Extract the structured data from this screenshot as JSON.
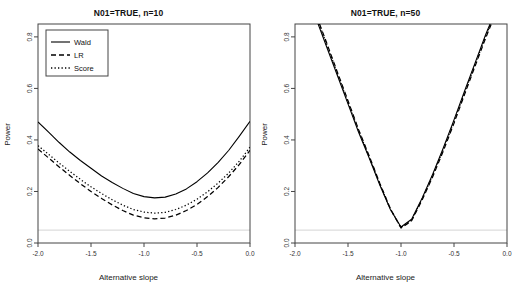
{
  "figure": {
    "background": "#ffffff",
    "axis_color": "#444444",
    "line_color": "#000000",
    "ref_line_color": "#dddddd"
  },
  "panels": [
    {
      "id": "left",
      "title": "N01=TRUE, n=10",
      "xlabel": "Alternative slope",
      "ylabel": "Power",
      "xticks": [
        "-2.0",
        "-1.5",
        "-1.0",
        "-0.5",
        "0.0"
      ],
      "yticks": [
        "0.0",
        "0.2",
        "0.4",
        "0.6",
        "0.8"
      ],
      "legend": {
        "visible": true,
        "items": [
          {
            "label": "Wald",
            "style": "solid"
          },
          {
            "label": "LR",
            "style": "dashed"
          },
          {
            "label": "Score",
            "style": "dotted"
          }
        ]
      }
    },
    {
      "id": "right",
      "title": "N01=TRUE, n=50",
      "xlabel": "Alternative slope",
      "ylabel": "Power",
      "xticks": [
        "-2.0",
        "-1.5",
        "-1.0",
        "-0.5",
        "0.0"
      ],
      "yticks": [
        "0.0",
        "0.2",
        "0.4",
        "0.6",
        "0.8"
      ],
      "legend": {
        "visible": false,
        "items": []
      }
    }
  ],
  "chart_data": [
    {
      "type": "line",
      "title": "N01=TRUE, n=10",
      "xlabel": "Alternative slope",
      "ylabel": "Power",
      "xlim": [
        -2.0,
        0.0
      ],
      "ylim": [
        0.0,
        0.85
      ],
      "grid": false,
      "legend_position": "top-left",
      "reference_line": {
        "y": 0.05,
        "style": "solid",
        "color": "#dddddd"
      },
      "x": [
        -2.0,
        -1.9,
        -1.8,
        -1.7,
        -1.6,
        -1.5,
        -1.4,
        -1.3,
        -1.2,
        -1.1,
        -1.0,
        -0.9,
        -0.8,
        -0.7,
        -0.6,
        -0.5,
        -0.4,
        -0.3,
        -0.2,
        -0.1,
        0.0
      ],
      "series": [
        {
          "name": "Wald",
          "style": "solid",
          "values": [
            0.47,
            0.43,
            0.39,
            0.353,
            0.32,
            0.29,
            0.26,
            0.235,
            0.212,
            0.192,
            0.18,
            0.175,
            0.178,
            0.19,
            0.21,
            0.238,
            0.272,
            0.313,
            0.36,
            0.415,
            0.472
          ]
        },
        {
          "name": "LR",
          "style": "dashed",
          "values": [
            0.365,
            0.33,
            0.295,
            0.262,
            0.23,
            0.2,
            0.173,
            0.148,
            0.126,
            0.108,
            0.098,
            0.094,
            0.097,
            0.108,
            0.126,
            0.15,
            0.18,
            0.216,
            0.258,
            0.305,
            0.36
          ]
        },
        {
          "name": "Score",
          "style": "dotted",
          "values": [
            0.378,
            0.344,
            0.31,
            0.278,
            0.247,
            0.218,
            0.192,
            0.168,
            0.147,
            0.13,
            0.12,
            0.116,
            0.119,
            0.13,
            0.147,
            0.17,
            0.199,
            0.233,
            0.272,
            0.318,
            0.372
          ]
        }
      ]
    },
    {
      "type": "line",
      "title": "N01=TRUE, n=50",
      "xlabel": "Alternative slope",
      "ylabel": "Power",
      "xlim": [
        -2.0,
        0.0
      ],
      "ylim": [
        0.0,
        0.85
      ],
      "grid": false,
      "legend_position": "none",
      "reference_line": {
        "y": 0.05,
        "style": "solid",
        "color": "#dddddd"
      },
      "x": [
        -1.9,
        -1.8,
        -1.7,
        -1.6,
        -1.5,
        -1.4,
        -1.3,
        -1.2,
        -1.1,
        -1.0,
        -0.9,
        -0.8,
        -0.7,
        -0.6,
        -0.5,
        -0.4,
        -0.3,
        -0.2,
        -0.15
      ],
      "series": [
        {
          "name": "Wald",
          "style": "solid",
          "values": [
            0.98,
            0.87,
            0.76,
            0.65,
            0.54,
            0.43,
            0.33,
            0.225,
            0.13,
            0.062,
            0.092,
            0.175,
            0.268,
            0.37,
            0.478,
            0.59,
            0.7,
            0.81,
            0.86
          ]
        },
        {
          "name": "LR",
          "style": "dashed",
          "values": [
            0.995,
            0.885,
            0.775,
            0.663,
            0.552,
            0.44,
            0.338,
            0.232,
            0.133,
            0.058,
            0.086,
            0.168,
            0.258,
            0.358,
            0.465,
            0.577,
            0.688,
            0.797,
            0.848
          ]
        },
        {
          "name": "Score",
          "style": "dotted",
          "values": [
            0.99,
            0.88,
            0.77,
            0.658,
            0.547,
            0.436,
            0.334,
            0.229,
            0.131,
            0.06,
            0.089,
            0.172,
            0.263,
            0.364,
            0.471,
            0.583,
            0.694,
            0.803,
            0.854
          ]
        }
      ]
    }
  ]
}
